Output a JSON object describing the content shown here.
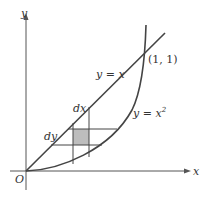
{
  "diagram": {
    "axes": {
      "x_label": "x",
      "y_label": "y",
      "origin_label": "O"
    },
    "curves": [
      {
        "name": "line",
        "label": "y = x"
      },
      {
        "name": "parabola",
        "label": "y = x",
        "label_sup": "2"
      }
    ],
    "intersection_label": "(1, 1)",
    "differentials": {
      "dx": "dx",
      "dy": "dy"
    },
    "colors": {
      "stroke": "#444444",
      "shade": "#bdbdbd"
    }
  }
}
